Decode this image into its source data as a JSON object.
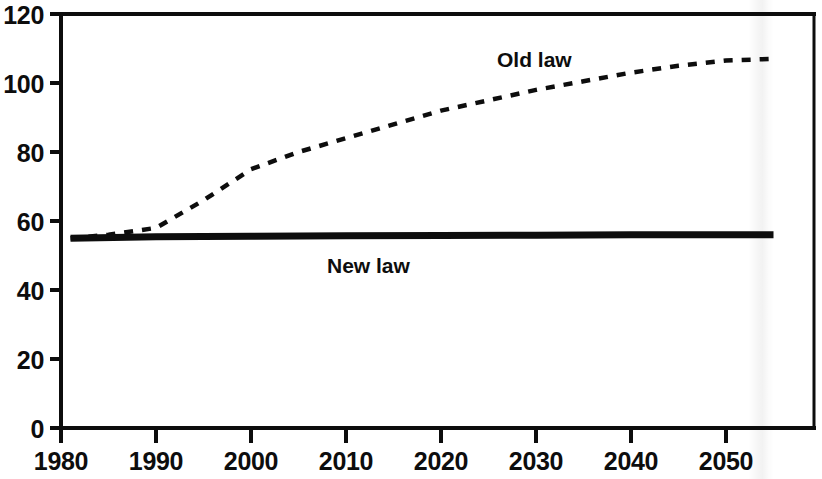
{
  "chart_data": {
    "type": "line",
    "title": "",
    "subtitle": "",
    "xlabel": "",
    "ylabel": "",
    "xlim": [
      1980,
      2057
    ],
    "ylim": [
      0,
      120
    ],
    "grid": false,
    "legend_position": "inline-annotation",
    "x_ticks": [
      "1980",
      "1990",
      "2000",
      "2010",
      "2020",
      "2030",
      "2040",
      "2050"
    ],
    "y_ticks": [
      "0",
      "20",
      "40",
      "60",
      "80",
      "100",
      "120"
    ],
    "x_tick_values": [
      1980,
      1990,
      2000,
      2010,
      2020,
      2030,
      2040,
      2050
    ],
    "y_tick_values": [
      0,
      20,
      40,
      60,
      80,
      100,
      120
    ],
    "series": [
      {
        "name": "Old law",
        "style": "dashed",
        "color": "#0d0d0d",
        "x": [
          1981,
          1985,
          1990,
          1995,
          2000,
          2005,
          2010,
          2015,
          2020,
          2025,
          2030,
          2035,
          2040,
          2045,
          2050,
          2055
        ],
        "values": [
          55,
          56,
          58,
          66,
          75,
          80,
          84,
          88,
          92,
          95,
          98,
          100.5,
          103,
          105,
          106.5,
          107
        ]
      },
      {
        "name": "New law",
        "style": "solid",
        "color": "#0d0d0d",
        "x": [
          1981,
          1990,
          2000,
          2010,
          2020,
          2030,
          2040,
          2050,
          2055
        ],
        "values": [
          55,
          55.4,
          55.6,
          55.7,
          55.8,
          55.9,
          56,
          56,
          56
        ]
      }
    ],
    "annotations": [
      {
        "text": "Old law",
        "x": 2023,
        "y": 112
      },
      {
        "text": "New law",
        "x": 2008,
        "y": 49
      }
    ]
  }
}
